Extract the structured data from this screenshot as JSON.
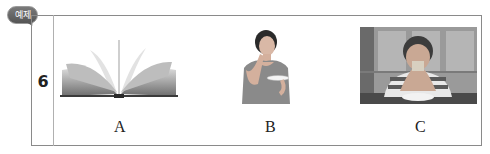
{
  "badge": {
    "label": "예제"
  },
  "question": {
    "number": "6",
    "options": [
      {
        "label": "A",
        "image": "open-book"
      },
      {
        "label": "B",
        "image": "woman-drinking-from-cup"
      },
      {
        "label": "C",
        "image": "boy-eating-sandwich"
      }
    ]
  }
}
